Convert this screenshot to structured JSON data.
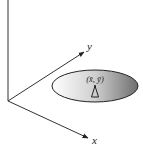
{
  "diagram": {
    "axes": {
      "vertical": {
        "label": ""
      },
      "x": {
        "label": "x"
      },
      "y": {
        "label": "y"
      }
    },
    "ellipse": {
      "label": "(x̄, ȳ)",
      "fill_light": "#ffffff",
      "fill_dark": "#6e6e6e",
      "marker": "antenna-triangle"
    },
    "colors": {
      "stroke": "#333333"
    }
  }
}
